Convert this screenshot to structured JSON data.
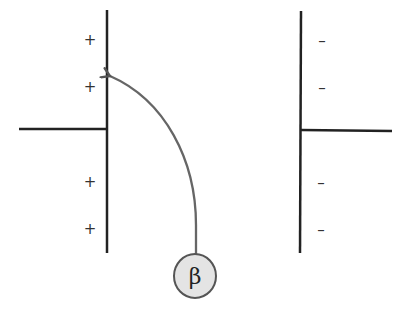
{
  "diagram": {
    "type": "beta particle deflection between charged plates",
    "left_plate": {
      "charge": "positive",
      "signs": [
        "+",
        "+",
        "+",
        "+"
      ]
    },
    "right_plate": {
      "charge": "negative",
      "signs": [
        "–",
        "–",
        "–",
        "–"
      ]
    },
    "particle": {
      "label": "β",
      "fill_color": "#e4e4e4",
      "stroke_color": "#555555"
    },
    "path_color": "#666666",
    "plate_color": "#222222"
  }
}
